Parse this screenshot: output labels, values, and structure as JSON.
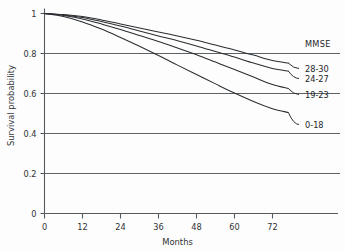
{
  "chart_data": {
    "type": "line",
    "title": "",
    "subtitle": "",
    "xlabel": "Months",
    "ylabel": "Survival probability",
    "xlim": [
      0,
      78
    ],
    "ylim": [
      0,
      1
    ],
    "xticks": [
      0,
      12,
      24,
      36,
      48,
      60,
      72
    ],
    "xtick_labels": [
      "0",
      "12",
      "24",
      "36",
      "48",
      "60",
      "72"
    ],
    "yticks": [
      0,
      0.2,
      0.4,
      0.6,
      0.8,
      1
    ],
    "ytick_labels": [
      "0",
      "0.2",
      "0.4",
      "0.6",
      "0.8",
      "1"
    ],
    "grid": "horizontal",
    "legend_position": "right",
    "legend_title": "MMSE",
    "x": [
      0,
      6,
      12,
      18,
      24,
      30,
      36,
      42,
      48,
      54,
      60,
      66,
      72,
      77
    ],
    "series": [
      {
        "name": "28-30",
        "label": "28-30",
        "values": [
          1.0,
          0.995,
          0.985,
          0.968,
          0.948,
          0.928,
          0.908,
          0.888,
          0.866,
          0.842,
          0.818,
          0.792,
          0.765,
          0.752
        ]
      },
      {
        "name": "24-27",
        "label": "24-27",
        "values": [
          1.0,
          0.993,
          0.98,
          0.96,
          0.937,
          0.912,
          0.888,
          0.864,
          0.838,
          0.81,
          0.782,
          0.752,
          0.725,
          0.712
        ]
      },
      {
        "name": "19-23",
        "label": "19-23",
        "values": [
          1.0,
          0.99,
          0.973,
          0.948,
          0.92,
          0.89,
          0.86,
          0.828,
          0.794,
          0.757,
          0.72,
          0.682,
          0.645,
          0.625
        ]
      },
      {
        "name": "0-18",
        "label": "0-18",
        "values": [
          1.0,
          0.985,
          0.958,
          0.922,
          0.88,
          0.836,
          0.79,
          0.742,
          0.695,
          0.648,
          0.602,
          0.56,
          0.524,
          0.505
        ]
      }
    ],
    "colors": {
      "curve": "#2a2d30",
      "grid": "#5d6266",
      "axis": "#555a5e",
      "background": "#fdfdfd",
      "text": "#232629"
    }
  },
  "legend": {
    "title": "MMSE",
    "entries": [
      "28-30",
      "24-27",
      "19-23",
      "0-18"
    ]
  },
  "axes": {
    "x_title": "Months",
    "y_title": "Survival probability"
  }
}
